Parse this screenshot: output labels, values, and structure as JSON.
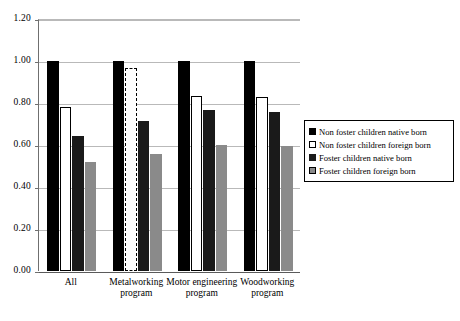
{
  "chart_data": {
    "type": "bar",
    "title": "",
    "xlabel": "",
    "ylabel": "",
    "ylim": [
      0.0,
      1.2
    ],
    "yticks": [
      "0.00",
      "0.20",
      "0.40",
      "0.60",
      "0.80",
      "1.00",
      "1.20"
    ],
    "ytick_values": [
      0.0,
      0.2,
      0.4,
      0.6,
      0.8,
      1.0,
      1.2
    ],
    "grid": "horizontal",
    "legend_position": "right",
    "categories": [
      "All",
      "Metalworking program",
      "Motor engineering program",
      "Woodworking program"
    ],
    "category_lines": [
      [
        "All"
      ],
      [
        "Metalworking",
        "program"
      ],
      [
        "Motor engineering",
        "program"
      ],
      [
        "Woodworking",
        "program"
      ]
    ],
    "series": [
      {
        "name": "Non foster children native born",
        "swatch": "s0",
        "color": "#000000",
        "values": [
          1.0,
          1.0,
          1.0,
          1.0
        ],
        "styles": [
          "solid",
          "solid",
          "solid",
          "solid"
        ]
      },
      {
        "name": "Non foster children foreign born",
        "swatch": "s1",
        "color": "#ffffff",
        "values": [
          0.78,
          0.965,
          0.835,
          0.83
        ],
        "styles": [
          "solid",
          "dashed",
          "solid",
          "solid"
        ]
      },
      {
        "name": "Foster children native born",
        "swatch": "s2",
        "color": "#1a1a1a",
        "values": [
          0.645,
          0.715,
          0.765,
          0.755
        ],
        "styles": [
          "solid",
          "solid",
          "solid",
          "solid"
        ]
      },
      {
        "name": "Foster children foreign born",
        "swatch": "s3",
        "color": "#8a8a8a",
        "values": [
          0.52,
          0.555,
          0.6,
          0.595
        ],
        "styles": [
          "solid",
          "solid",
          "solid",
          "solid"
        ]
      }
    ]
  },
  "legend": {
    "items": [
      {
        "label": "Non foster children native born",
        "swatch": "s0"
      },
      {
        "label": "Non foster children foreign born",
        "swatch": "s1"
      },
      {
        "label": "Foster children native born",
        "swatch": "s2"
      },
      {
        "label": "Foster children foreign born",
        "swatch": "s3"
      }
    ]
  }
}
